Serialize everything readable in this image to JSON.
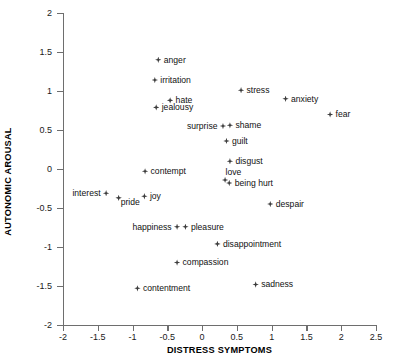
{
  "chart_data": {
    "type": "scatter",
    "title": "",
    "xlabel": "DISTRESS SYMPTOMS",
    "ylabel": "AUTONOMIC AROUSAL",
    "xlim": [
      -2,
      2.5
    ],
    "ylim": [
      -2,
      2
    ],
    "xticks": [
      "-2",
      "-1.5",
      "-1",
      "-0.5",
      "0",
      "0.5",
      "1",
      "1.5",
      "2",
      "2.5"
    ],
    "xtick_values": [
      -2,
      -1.5,
      -1,
      -0.5,
      0,
      0.5,
      1,
      1.5,
      2,
      2.5
    ],
    "yticks": [
      "2",
      "1.5",
      "1",
      "0.5",
      "0",
      "-0.5",
      "-1",
      "-1.5",
      "-2"
    ],
    "ytick_values": [
      2,
      1.5,
      1,
      0.5,
      0,
      -0.5,
      -1,
      -1.5,
      -2
    ],
    "grid": false,
    "legend": false,
    "marker_color": "#3d3d3d",
    "axis_color": "#6e6e6e",
    "points": [
      {
        "label": "anger",
        "x": -0.63,
        "y": 1.4,
        "label_pos": "right"
      },
      {
        "label": "irritation",
        "x": -0.68,
        "y": 1.14,
        "label_pos": "right"
      },
      {
        "label": "stress",
        "x": 0.56,
        "y": 1.01,
        "label_pos": "right"
      },
      {
        "label": "anxiety",
        "x": 1.2,
        "y": 0.9,
        "label_pos": "right"
      },
      {
        "label": "hate",
        "x": -0.46,
        "y": 0.88,
        "label_pos": "right"
      },
      {
        "label": "jealousy",
        "x": -0.66,
        "y": 0.79,
        "label_pos": "right"
      },
      {
        "label": "fear",
        "x": 1.84,
        "y": 0.7,
        "label_pos": "right"
      },
      {
        "label": "surprise",
        "x": 0.3,
        "y": 0.55,
        "label_pos": "left"
      },
      {
        "label": "shame",
        "x": 0.4,
        "y": 0.56,
        "label_pos": "right"
      },
      {
        "label": "guilt",
        "x": 0.35,
        "y": 0.36,
        "label_pos": "right"
      },
      {
        "label": "disgust",
        "x": 0.4,
        "y": 0.1,
        "label_pos": "right"
      },
      {
        "label": "contempt",
        "x": -0.82,
        "y": -0.03,
        "label_pos": "right"
      },
      {
        "label": "love",
        "x": 0.33,
        "y": -0.14,
        "label_pos": "above"
      },
      {
        "label": "being hurt",
        "x": 0.39,
        "y": -0.18,
        "label_pos": "right"
      },
      {
        "label": "interest",
        "x": -1.38,
        "y": -0.31,
        "label_pos": "left"
      },
      {
        "label": "joy",
        "x": -0.83,
        "y": -0.35,
        "label_pos": "right"
      },
      {
        "label": "pride",
        "x": -1.2,
        "y": -0.37,
        "label_pos": "below"
      },
      {
        "label": "despair",
        "x": 0.98,
        "y": -0.45,
        "label_pos": "right"
      },
      {
        "label": "happiness",
        "x": -0.36,
        "y": -0.74,
        "label_pos": "left"
      },
      {
        "label": "pleasure",
        "x": -0.24,
        "y": -0.74,
        "label_pos": "right"
      },
      {
        "label": "disappointment",
        "x": 0.22,
        "y": -0.96,
        "label_pos": "right"
      },
      {
        "label": "compassion",
        "x": -0.36,
        "y": -1.2,
        "label_pos": "right"
      },
      {
        "label": "sadness",
        "x": 0.77,
        "y": -1.48,
        "label_pos": "right"
      },
      {
        "label": "contentment",
        "x": -0.93,
        "y": -1.53,
        "label_pos": "right"
      }
    ]
  }
}
